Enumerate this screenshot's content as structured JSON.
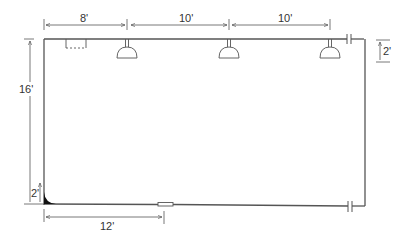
{
  "diagram": {
    "type": "floor plan / room elevation with lighting fixtures",
    "colors": {
      "line": "#555555",
      "text": "#333333",
      "background": "#ffffff"
    },
    "dimensions": {
      "top": [
        {
          "label": "8'",
          "from": "left wall",
          "to": "first light"
        },
        {
          "label": "10'",
          "from": "first light",
          "to": "second light"
        },
        {
          "label": "10'",
          "from": "second light",
          "to": "third light"
        }
      ],
      "left_height": {
        "label": "16'"
      },
      "left_bottom_small": {
        "label": "2'"
      },
      "right_small": {
        "label": "2'"
      },
      "bottom": {
        "label": "12'"
      }
    },
    "fixtures": [
      {
        "name": "pendant-light-1"
      },
      {
        "name": "pendant-light-2"
      },
      {
        "name": "pendant-light-3"
      }
    ],
    "elements": [
      "dashed box (top-left)",
      "wall break marks (right)",
      "small opening on bottom wall",
      "corner fillet (bottom-left)"
    ]
  }
}
